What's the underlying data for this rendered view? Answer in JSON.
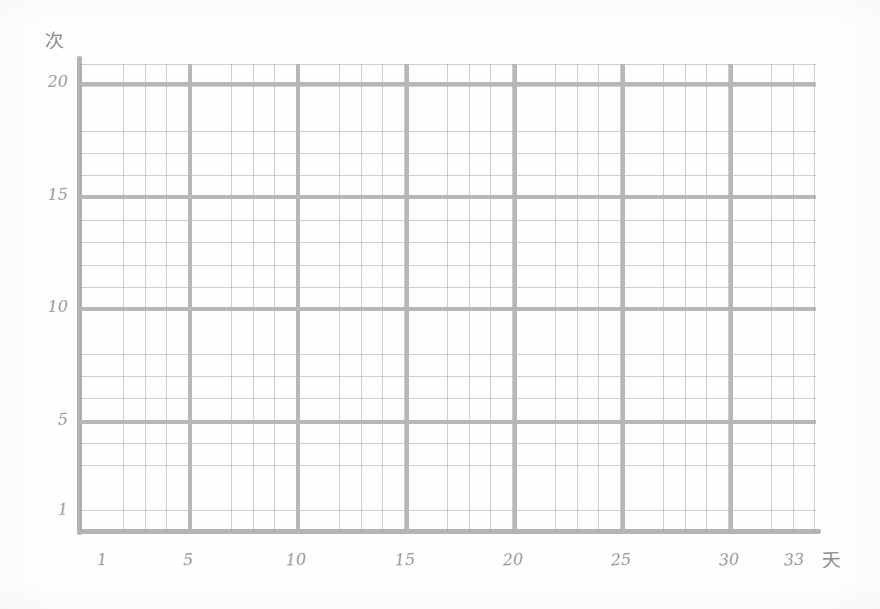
{
  "chart_data": {
    "type": "line",
    "title": "",
    "subtitle": "",
    "xlabel": "天",
    "ylabel": "次",
    "xlabel_meaning": "day",
    "ylabel_meaning": "times",
    "x_tick_labels": [
      "1",
      "5",
      "10",
      "15",
      "20",
      "25",
      "30",
      "33"
    ],
    "x_tick_values": [
      1,
      5,
      10,
      15,
      20,
      25,
      30,
      33
    ],
    "y_tick_labels": [
      "1",
      "5",
      "10",
      "15",
      "20"
    ],
    "y_tick_values": [
      1,
      5,
      10,
      15,
      20
    ],
    "xlim": [
      0,
      34
    ],
    "ylim": [
      0,
      20.8
    ],
    "grid": true,
    "minor_grid": true,
    "major_grid_x_step": 5,
    "major_grid_y_step": 5,
    "minor_grid_x_step": 1,
    "minor_grid_y_step": 1,
    "legend": null,
    "legend_position": "none",
    "annotations": [],
    "series": [],
    "values": [],
    "categories": [],
    "note": "Blank hand-drawn graph-paper grid; no data plotted."
  },
  "axes": {
    "y_unit": "次",
    "x_unit": "天",
    "y_ticks": [
      {
        "label": "20",
        "value": 20
      },
      {
        "label": "15",
        "value": 15
      },
      {
        "label": "10",
        "value": 10
      },
      {
        "label": "5",
        "value": 5
      },
      {
        "label": "1",
        "value": 1
      }
    ],
    "x_ticks": [
      {
        "label": "1",
        "value": 1
      },
      {
        "label": "5",
        "value": 5
      },
      {
        "label": "10",
        "value": 10
      },
      {
        "label": "15",
        "value": 15
      },
      {
        "label": "20",
        "value": 20
      },
      {
        "label": "25",
        "value": 25
      },
      {
        "label": "30",
        "value": 30
      },
      {
        "label": "33",
        "value": 33
      }
    ]
  },
  "colors": {
    "paper": "#fefefe",
    "major_grid": "#b7b7ba",
    "minor_grid": "#96969c",
    "axis": "#b4b4b8",
    "text": "#9a9a9e"
  }
}
